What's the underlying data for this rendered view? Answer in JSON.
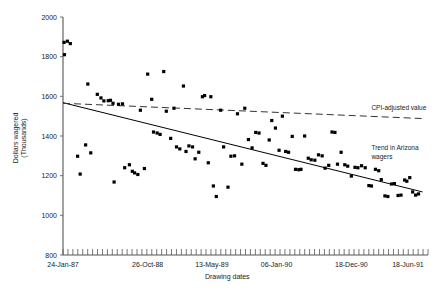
{
  "chart_data": {
    "type": "scatter",
    "title": "",
    "xlabel": "Drawing dates",
    "ylabel": "Dollars wagered (Thousands)",
    "ylim": [
      800,
      2000
    ],
    "ytick_labels": [
      "2000",
      "1800",
      "1600",
      "1400",
      "1200",
      "1000",
      "800"
    ],
    "yticks": [
      2000,
      1800,
      1600,
      1400,
      1200,
      1000,
      800
    ],
    "xtick_labels": [
      "24-Jan-87",
      "26-Oct-88",
      "13-May-89",
      "06-Jan-90",
      "18-Dec-90",
      "18-Jun-91"
    ],
    "xtick_positions": [
      0,
      0.232,
      0.408,
      0.585,
      0.79,
      0.945
    ],
    "xlim": [
      0,
      1
    ],
    "grid": false,
    "legend": "annotations",
    "annotations": [
      {
        "name": "cpi-adjusted-value",
        "text": "CPI-adjusted value",
        "x": 0.845,
        "y": 1530
      },
      {
        "name": "trend-in-arizona-wagers",
        "text": "Trend in Arizona wagers",
        "x": 0.845,
        "y": 1330
      }
    ],
    "series": [
      {
        "name": "Arizona wagers (drawings)",
        "type": "scatter",
        "marker": "square",
        "color": "#000000",
        "points": [
          [
            0.003,
            1872
          ],
          [
            0.012,
            1878
          ],
          [
            0.02,
            1866
          ],
          [
            0.004,
            1810
          ],
          [
            0.04,
            1298
          ],
          [
            0.047,
            1208
          ],
          [
            0.062,
            1355
          ],
          [
            0.068,
            1662
          ],
          [
            0.076,
            1315
          ],
          [
            0.094,
            1610
          ],
          [
            0.104,
            1592
          ],
          [
            0.112,
            1577
          ],
          [
            0.124,
            1578
          ],
          [
            0.13,
            1580
          ],
          [
            0.137,
            1565
          ],
          [
            0.14,
            1168
          ],
          [
            0.152,
            1560
          ],
          [
            0.163,
            1562
          ],
          [
            0.169,
            1240
          ],
          [
            0.182,
            1255
          ],
          [
            0.19,
            1222
          ],
          [
            0.196,
            1214
          ],
          [
            0.205,
            1206
          ],
          [
            0.212,
            1530
          ],
          [
            0.223,
            1236
          ],
          [
            0.232,
            1712
          ],
          [
            0.243,
            1585
          ],
          [
            0.248,
            1420
          ],
          [
            0.258,
            1415
          ],
          [
            0.266,
            1408
          ],
          [
            0.276,
            1725
          ],
          [
            0.283,
            1525
          ],
          [
            0.295,
            1388
          ],
          [
            0.304,
            1540
          ],
          [
            0.311,
            1345
          ],
          [
            0.32,
            1335
          ],
          [
            0.33,
            1652
          ],
          [
            0.337,
            1322
          ],
          [
            0.345,
            1350
          ],
          [
            0.355,
            1345
          ],
          [
            0.362,
            1285
          ],
          [
            0.372,
            1318
          ],
          [
            0.382,
            1598
          ],
          [
            0.388,
            1604
          ],
          [
            0.398,
            1265
          ],
          [
            0.405,
            1598
          ],
          [
            0.412,
            1148
          ],
          [
            0.42,
            1095
          ],
          [
            0.432,
            1530
          ],
          [
            0.44,
            1345
          ],
          [
            0.452,
            1142
          ],
          [
            0.46,
            1298
          ],
          [
            0.47,
            1300
          ],
          [
            0.478,
            1512
          ],
          [
            0.49,
            1258
          ],
          [
            0.498,
            1540
          ],
          [
            0.508,
            1382
          ],
          [
            0.518,
            1340
          ],
          [
            0.528,
            1418
          ],
          [
            0.537,
            1415
          ],
          [
            0.548,
            1262
          ],
          [
            0.556,
            1252
          ],
          [
            0.565,
            1380
          ],
          [
            0.572,
            1478
          ],
          [
            0.582,
            1440
          ],
          [
            0.592,
            1328
          ],
          [
            0.601,
            1500
          ],
          [
            0.61,
            1322
          ],
          [
            0.618,
            1318
          ],
          [
            0.628,
            1398
          ],
          [
            0.637,
            1232
          ],
          [
            0.646,
            1230
          ],
          [
            0.652,
            1232
          ],
          [
            0.662,
            1400
          ],
          [
            0.672,
            1288
          ],
          [
            0.68,
            1280
          ],
          [
            0.69,
            1278
          ],
          [
            0.7,
            1305
          ],
          [
            0.71,
            1300
          ],
          [
            0.718,
            1238
          ],
          [
            0.728,
            1252
          ],
          [
            0.737,
            1420
          ],
          [
            0.745,
            1418
          ],
          [
            0.752,
            1258
          ],
          [
            0.762,
            1318
          ],
          [
            0.772,
            1255
          ],
          [
            0.78,
            1248
          ],
          [
            0.79,
            1198
          ],
          [
            0.8,
            1242
          ],
          [
            0.808,
            1240
          ],
          [
            0.818,
            1250
          ],
          [
            0.828,
            1240
          ],
          [
            0.838,
            1150
          ],
          [
            0.845,
            1148
          ],
          [
            0.856,
            1232
          ],
          [
            0.865,
            1225
          ],
          [
            0.872,
            1180
          ],
          [
            0.882,
            1098
          ],
          [
            0.89,
            1095
          ],
          [
            0.9,
            1158
          ],
          [
            0.908,
            1160
          ],
          [
            0.918,
            1100
          ],
          [
            0.926,
            1102
          ],
          [
            0.936,
            1178
          ],
          [
            0.942,
            1172
          ],
          [
            0.95,
            1190
          ],
          [
            0.958,
            1118
          ],
          [
            0.966,
            1102
          ],
          [
            0.974,
            1108
          ]
        ]
      }
    ],
    "lines": [
      {
        "name": "Trend in Arizona wagers",
        "style": "solid",
        "color": "#000000",
        "x_start": 0.0,
        "y_start": 1568,
        "x_end": 0.985,
        "y_end": 1118
      },
      {
        "name": "CPI-adjusted value",
        "style": "dashed",
        "color": "#333333",
        "x_start": 0.0,
        "y_start": 1565,
        "x_end": 0.985,
        "y_end": 1488
      }
    ]
  }
}
